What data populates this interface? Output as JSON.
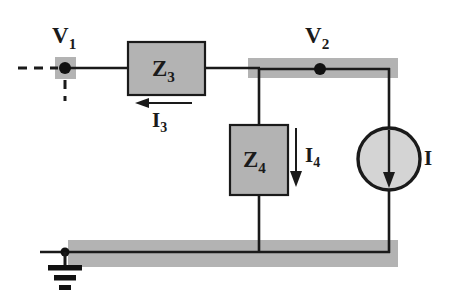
{
  "diagram": {
    "type": "electrical-circuit-schematic",
    "background_color": "#ffffff",
    "wire_color": "#1a1a1a",
    "block_fill_color": "#b3b3b3",
    "block_stroke_color": "#1a1a1a",
    "bus_highlight_color": "#b3b3b3",
    "source_fill_color": "#d4d4d4"
  },
  "nodes": [
    {
      "id": "v1",
      "label": "V",
      "subscript": "1",
      "label_x": 52,
      "label_y": 24,
      "dot_x": 65,
      "dot_y": 68,
      "highlight": {
        "x": 55,
        "y": 57,
        "w": 21,
        "h": 22
      }
    },
    {
      "id": "v2",
      "label": "V",
      "subscript": "2",
      "label_x": 305,
      "label_y": 24,
      "dot_x": 320,
      "dot_y": 69,
      "highlight": {
        "x": 248,
        "y": 58,
        "w": 150,
        "h": 20
      }
    }
  ],
  "components": [
    {
      "id": "z3",
      "label": "Z",
      "subscript": "3",
      "kind": "impedance-block",
      "orientation": "horizontal",
      "x": 128,
      "y": 42,
      "w": 77,
      "h": 53,
      "label_x": 152,
      "label_y": 57
    },
    {
      "id": "z4",
      "label": "Z",
      "subscript": "4",
      "kind": "impedance-block",
      "orientation": "vertical",
      "x": 230,
      "y": 125,
      "w": 58,
      "h": 70,
      "label_x": 243,
      "label_y": 148
    },
    {
      "id": "isrc",
      "label": "I",
      "subscript": "",
      "kind": "current-source",
      "cx": 389,
      "cy": 159,
      "r": 31,
      "arrow_direction": "down",
      "label_x": 424,
      "label_y": 148
    }
  ],
  "currents": [
    {
      "id": "i3",
      "label": "I",
      "subscript": "3",
      "direction": "left",
      "arrow_x1": 192,
      "arrow_x2": 137,
      "arrow_y": 103,
      "label_x": 152,
      "label_y": 110
    },
    {
      "id": "i4",
      "label": "I",
      "subscript": "4",
      "direction": "down",
      "arrow_x": 296,
      "arrow_y1": 128,
      "arrow_y2": 186,
      "label_x": 305,
      "label_y": 145
    }
  ],
  "ground": {
    "id": "gnd",
    "x": 65,
    "y": 252,
    "stem_bottom": 270,
    "bar_widths": [
      30,
      18,
      10
    ]
  },
  "buses": [
    {
      "id": "top-bus",
      "x": 248,
      "y": 58,
      "w": 150,
      "h": 20
    },
    {
      "id": "bottom-bus",
      "x": 68,
      "y": 240,
      "w": 330,
      "h": 27
    }
  ],
  "open_terminals": {
    "id": "v1-open-leads",
    "horizontal_dash": {
      "x1": 18,
      "x2": 58,
      "y": 68
    },
    "vertical_dash": {
      "x": 65,
      "y1": 79,
      "y2": 101
    }
  }
}
